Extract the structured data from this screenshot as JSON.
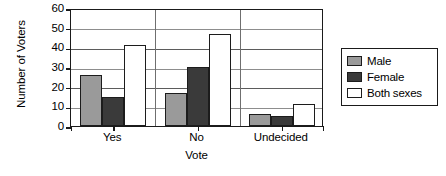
{
  "chart_data": {
    "type": "bar",
    "title": "",
    "xlabel": "Vote",
    "ylabel": "Number of Voters",
    "categories": [
      "Yes",
      "No",
      "Undecided"
    ],
    "series": [
      {
        "name": "Male",
        "color": "#9a9a9a",
        "values": [
          26,
          17,
          6
        ]
      },
      {
        "name": "Female",
        "color": "#3a3a3a",
        "values": [
          15,
          30,
          5
        ]
      },
      {
        "name": "Both sexes",
        "color": "#ffffff",
        "values": [
          41,
          47,
          11
        ]
      }
    ],
    "ylim": [
      0,
      60
    ],
    "yticks": [
      0,
      10,
      20,
      30,
      40,
      50,
      60
    ],
    "ytick_labels": [
      "0",
      "10",
      "20",
      "30",
      "40",
      "50",
      "60"
    ],
    "grid": true,
    "legend_position": "right-outside"
  },
  "legend": {
    "entries": [
      {
        "label": "Male"
      },
      {
        "label": "Female"
      },
      {
        "label": "Both sexes"
      }
    ]
  },
  "axes": {
    "y_title": "Number of Voters",
    "x_title": "Vote"
  }
}
